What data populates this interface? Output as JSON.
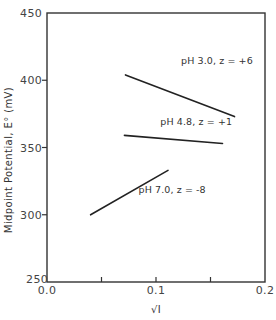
{
  "chart_data": {
    "type": "line",
    "title": "",
    "xlabel": "√I",
    "ylabel": "Midpoint Potential, E° (mV)",
    "xlim": [
      0.0,
      0.2
    ],
    "ylim": [
      250,
      450
    ],
    "grid": false,
    "legend_position": "inline labels",
    "x_ticks": [
      {
        "value": 0.0,
        "label": "0.0"
      },
      {
        "value": 0.1,
        "label": "0.1"
      },
      {
        "value": 0.2,
        "label": "0.2"
      }
    ],
    "x_minor_ticks": [
      0.05,
      0.1,
      0.15
    ],
    "y_ticks": [
      {
        "value": 250,
        "label": "250"
      },
      {
        "value": 300,
        "label": "300"
      },
      {
        "value": 350,
        "label": "350"
      },
      {
        "value": 400,
        "label": "400"
      },
      {
        "value": 450,
        "label": "450"
      }
    ],
    "series": [
      {
        "name": "pH 3.0, z = +6",
        "label": "pH 3.0, z = +6",
        "x": [
          0.072,
          0.172
        ],
        "y": [
          404,
          373
        ]
      },
      {
        "name": "pH 4.8, z = +1",
        "label": "pH 4.8, z = +1",
        "x": [
          0.071,
          0.161
        ],
        "y": [
          359,
          353
        ]
      },
      {
        "name": "pH 7.0, z = -8",
        "label": "pH 7.0, z = -8",
        "x": [
          0.04,
          0.111
        ],
        "y": [
          300,
          333
        ]
      }
    ],
    "annotations": [
      {
        "text": "pH 3.0, z = +6",
        "x": 0.123,
        "y": 412
      },
      {
        "text": "pH 4.8, z = +1",
        "x": 0.104,
        "y": 367
      },
      {
        "text": "pH 7.0, z = -8",
        "x": 0.084,
        "y": 316
      }
    ]
  },
  "layout": {
    "plot_px": {
      "left": 47,
      "top": 13,
      "right": 265,
      "bottom": 282
    }
  }
}
